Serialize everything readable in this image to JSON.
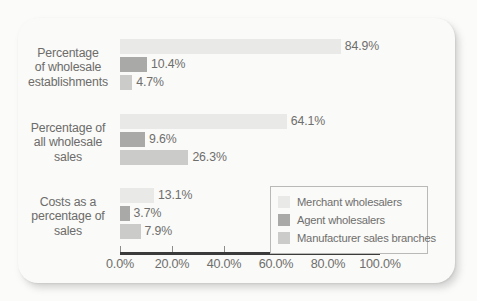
{
  "chart_data": {
    "type": "bar",
    "orientation": "horizontal",
    "title": "",
    "subtitle": "",
    "xlabel": "",
    "ylabel": "",
    "xlim": [
      0,
      100
    ],
    "grid": false,
    "legend_position": "inside-bottom-right",
    "categories": [
      "Percentage of wholesale establishments",
      "Percentage of all wholesale sales",
      "Costs as a percentage of sales"
    ],
    "category_label_lines": [
      [
        "Percentage",
        "of wholesale",
        "establishments"
      ],
      [
        "Percentage of",
        "all wholesale",
        "sales"
      ],
      [
        "Costs as a",
        "percentage of",
        "sales"
      ]
    ],
    "series": [
      {
        "name": "Merchant wholesalers",
        "color": "#e9e9e7",
        "values": [
          84.9,
          64.1,
          13.1
        ],
        "labels": [
          "84.9%",
          "64.1%",
          "13.1%"
        ]
      },
      {
        "name": "Agent wholesalers",
        "color": "#a9a9a7",
        "values": [
          10.4,
          9.6,
          3.7
        ],
        "labels": [
          "10.4%",
          "9.6%",
          "3.7%"
        ]
      },
      {
        "name": "Manufacturer sales branches",
        "color": "#cbcbc9",
        "values": [
          4.7,
          26.3,
          7.9
        ],
        "labels": [
          "4.7%",
          "26.3%",
          "7.9%"
        ]
      }
    ],
    "xticks": [
      0,
      20,
      40,
      60,
      80,
      100
    ],
    "xtick_labels": [
      "0.0%",
      "20.0%",
      "40.0%",
      "60.0%",
      "80.0%",
      "100.0%"
    ]
  },
  "legend": {
    "entries": [
      "Merchant wholesalers",
      "Agent wholesalers",
      "Manufacturer sales branches"
    ]
  },
  "colors": {
    "page_background": "#fbfbfa",
    "card_background": "#fafaf8",
    "axis": "#3b3b3b",
    "text": "#6e6e6c",
    "legend_border": "#b9b9b7"
  }
}
